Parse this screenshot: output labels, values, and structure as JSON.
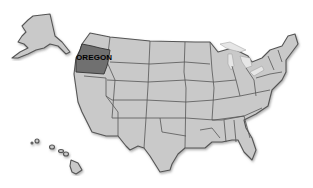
{
  "map": {
    "title_text_cut": "",
    "highlighted_state": {
      "name": "OREGON",
      "fill": "#707070"
    },
    "base_fill": "#c9c9c9",
    "border_color": "#555555",
    "region": "United States",
    "insets": [
      "Alaska",
      "Hawaii"
    ]
  }
}
